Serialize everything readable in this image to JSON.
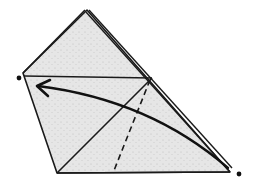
{
  "diagram": {
    "type": "origami-fold-step",
    "colors": {
      "paper": "#e4e4e4",
      "line": "#1a1a1a",
      "background": "#ffffff"
    },
    "paper_outline": [
      [
        85,
        10
      ],
      [
        23,
        73
      ],
      [
        57,
        173
      ],
      [
        230,
        172
      ],
      [
        152,
        78
      ]
    ],
    "back_layer_edge": [
      [
        89,
        10
      ],
      [
        232,
        168
      ]
    ],
    "crease_lines": [
      {
        "from": [
          23,
          76
        ],
        "to": [
          152,
          78
        ],
        "style": "solid"
      },
      {
        "from": [
          152,
          78
        ],
        "to": [
          57,
          173
        ],
        "style": "solid"
      },
      {
        "from": [
          150,
          80
        ],
        "to": [
          113,
          173
        ],
        "style": "dashed"
      }
    ],
    "reference_points": [
      {
        "name": "target-dot",
        "x": 19,
        "y": 78
      },
      {
        "name": "source-dot",
        "x": 239,
        "y": 174
      }
    ],
    "fold_arrow": {
      "from": [
        228,
        168
      ],
      "to": [
        36,
        87
      ],
      "curve_control": [
        140,
        100
      ]
    }
  }
}
